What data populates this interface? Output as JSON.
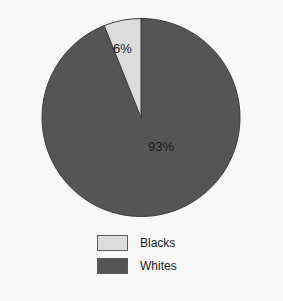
{
  "figure": {
    "background_color": "#f8f8f8",
    "width": 283,
    "height": 301
  },
  "chart_data": {
    "type": "pie",
    "title": "",
    "categories": [
      "Blacks",
      "Whites"
    ],
    "values": [
      6,
      93
    ],
    "value_labels": [
      "6%",
      "93%"
    ],
    "colors": [
      "#dcdcdc",
      "#555555"
    ],
    "slice_edge_color": "#3d3d3d",
    "start_angle_deg": 90,
    "direction": "counterclockwise",
    "legend_position": "bottom-center",
    "legend": [
      {
        "label": "Blacks",
        "color": "#dcdcdc"
      },
      {
        "label": "Whites",
        "color": "#555555"
      }
    ],
    "labels_inside": true,
    "xlabel": "",
    "ylabel": ""
  },
  "pie": {
    "center_x": 141,
    "center_y": 117.5,
    "radius": 99,
    "blacks_label": "6%",
    "whites_label": "93%"
  },
  "legend": {
    "items": [
      {
        "label": "Blacks"
      },
      {
        "label": "Whites"
      }
    ]
  }
}
